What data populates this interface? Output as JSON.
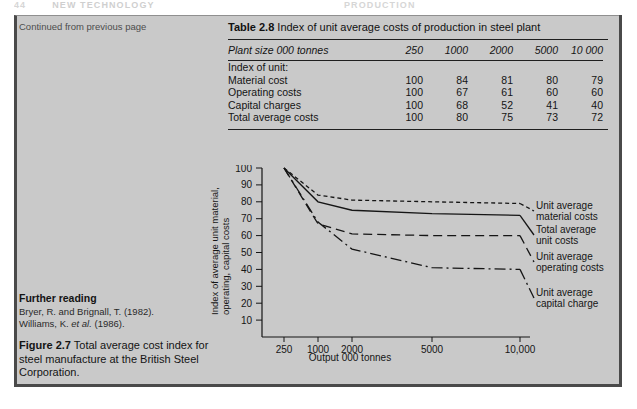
{
  "running_head": {
    "folio": "44",
    "left_title": "NEW TECHNOLOGY",
    "right_title": "PRODUCTION"
  },
  "panel": {
    "continued_note": "Continued from previous page"
  },
  "table": {
    "number_label": "Table 2.8",
    "title": "Index of unit average costs of production in steel plant",
    "header_stub": "Plant size 000 tonnes",
    "columns": [
      "250",
      "1000",
      "2000",
      "5000",
      "10 000"
    ],
    "section_label": "Index of unit:",
    "rows": [
      {
        "label": "Material cost",
        "values": [
          "100",
          "84",
          "81",
          "80",
          "79"
        ]
      },
      {
        "label": "Operating costs",
        "values": [
          "100",
          "67",
          "61",
          "60",
          "60"
        ]
      },
      {
        "label": "Capital charges",
        "values": [
          "100",
          "68",
          "52",
          "41",
          "40"
        ]
      },
      {
        "label": "Total average costs",
        "values": [
          "100",
          "80",
          "75",
          "73",
          "72"
        ]
      }
    ]
  },
  "further_reading": {
    "heading": "Further reading",
    "references": [
      {
        "pre": "Bryer, R. and Brignall, T. (1982).",
        "italic": "",
        "post": ""
      },
      {
        "pre": "Williams, K. ",
        "italic": "et al.",
        "post": " (1986)."
      }
    ]
  },
  "figure_caption": {
    "number_label": "Figure 2.7",
    "text": "Total average cost index for steel manufacture at the British Steel Corporation."
  },
  "chart_data": {
    "type": "line",
    "title": "",
    "xlabel": "Output 000 tonnes",
    "ylabel": "Index of average unit material, operating, capital costs",
    "categories": [
      "250",
      "1000",
      "2000",
      "5000",
      "10,000"
    ],
    "x": [
      250,
      1000,
      2000,
      5000,
      10000
    ],
    "xtick_labels": [
      "250",
      "1000",
      "2000",
      "5000",
      "10,000"
    ],
    "ytick_labels": [
      "10",
      "20",
      "30",
      "40",
      "50",
      "60",
      "70",
      "80",
      "90",
      "100"
    ],
    "ytick_values": [
      10,
      20,
      30,
      40,
      50,
      60,
      70,
      80,
      90,
      100
    ],
    "ylim": [
      0,
      100
    ],
    "grid": false,
    "legend_position": "right",
    "series": [
      {
        "name": "Unit average material costs",
        "style": "dotted",
        "values": [
          100,
          84,
          81,
          80,
          79
        ]
      },
      {
        "name": "Total average unit costs",
        "style": "solid",
        "values": [
          100,
          80,
          75,
          73,
          72
        ]
      },
      {
        "name": "Unit average operating costs",
        "style": "dashed",
        "values": [
          100,
          67,
          61,
          60,
          60
        ]
      },
      {
        "name": "Unit average capital charge",
        "style": "dash-dot",
        "values": [
          100,
          68,
          52,
          41,
          40
        ]
      }
    ],
    "legend": [
      {
        "line1": "Unit average",
        "line2": "material costs"
      },
      {
        "line1": "Total average",
        "line2": "unit costs"
      },
      {
        "line1": "Unit average",
        "line2": "operating costs"
      },
      {
        "line1": "Unit average",
        "line2": "capital charge"
      }
    ]
  },
  "colors": {
    "panel_background": "#c9c9c9",
    "page_background": "#ffffff",
    "ink": "#151515",
    "rule": "#1f1f1f",
    "frame": "#4a4a4a"
  }
}
